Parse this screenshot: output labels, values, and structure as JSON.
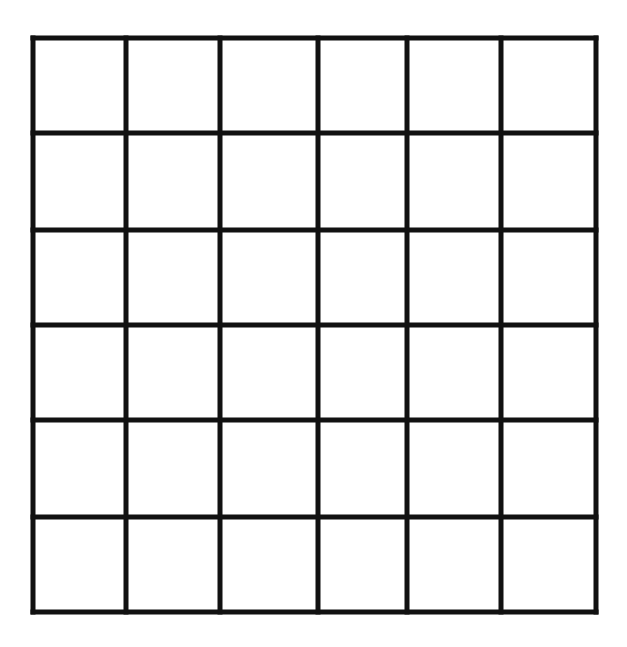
{
  "diagram": {
    "type": "grid",
    "rows": 6,
    "columns": 6,
    "line_color": "#111111",
    "background_color": "#ffffff",
    "line_width": 5,
    "vertical_lines_x": [
      33,
      126,
      220,
      318,
      407,
      501,
      596
    ],
    "horizontal_lines_y": [
      38,
      133,
      230,
      325,
      420,
      517,
      612
    ],
    "cells_content": "empty"
  }
}
